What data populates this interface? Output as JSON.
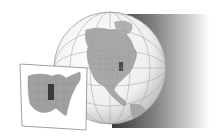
{
  "figure": {
    "type": "locator-map",
    "style": "grayscale",
    "globe": {
      "region_shown": "North America",
      "highlighted_state": "Illinois",
      "highlight_color": "#4a4a4a",
      "land_color": "#a8a8a8",
      "ocean_color": "#f4f4f4",
      "shadow_color": "#3a3a3a"
    },
    "inset": {
      "region_shown": "Eastern United States",
      "highlighted_state": "Illinois",
      "highlight_color": "#3a3a3a",
      "land_color": "#a0a0a0",
      "frame_color": "#ffffff"
    }
  }
}
